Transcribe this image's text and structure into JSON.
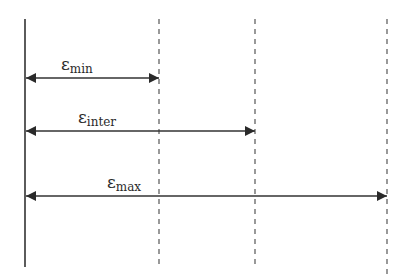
{
  "diagram": {
    "baseline": {
      "x": 25,
      "y_top": 19,
      "y_bottom": 267
    },
    "dashed_lines": [
      {
        "id": "min",
        "x": 159,
        "y_top": 19,
        "y_bottom": 267
      },
      {
        "id": "inter",
        "x": 255,
        "y_top": 19,
        "y_bottom": 267
      },
      {
        "id": "max",
        "x": 387,
        "y_top": 19,
        "y_bottom": 278
      }
    ],
    "arrows": [
      {
        "id": "min",
        "symbol": "ε",
        "subscript": "min",
        "y": 78,
        "x_end": 159,
        "label_x": 61,
        "label_y": 70
      },
      {
        "id": "inter",
        "symbol": "ε",
        "subscript": "inter",
        "y": 131,
        "x_end": 255,
        "label_x": 78,
        "label_y": 123
      },
      {
        "id": "max",
        "symbol": "ε",
        "subscript": "max",
        "y": 196,
        "x_end": 387,
        "label_x": 107,
        "label_y": 188
      }
    ],
    "colors": {
      "line": "#333333",
      "dash": "#555555"
    }
  }
}
